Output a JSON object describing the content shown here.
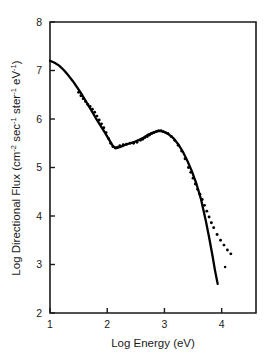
{
  "chart_data": {
    "type": "line",
    "title": "",
    "xlabel": "Log Energy (eV)",
    "ylabel": "Log Directional Flux (cm-2 sec-1 ster-1 eV-1)",
    "ylabel_parts": {
      "main": "Log Directional Flux  (cm",
      "sup1": "-2",
      "mid1": " sec",
      "sup2": "-1",
      "mid2": " ster",
      "sup3": "-1",
      "mid3": " eV",
      "sup4": "-1",
      "tail": ")"
    },
    "xlim": [
      1,
      4.6
    ],
    "ylim": [
      2,
      8
    ],
    "xticks": [
      1,
      2,
      3,
      4
    ],
    "xticklabels": [
      "1",
      "2",
      "3",
      "4"
    ],
    "yticks": [
      2,
      3,
      4,
      5,
      6,
      7,
      8
    ],
    "yticklabels": [
      "2",
      "3",
      "4",
      "5",
      "6",
      "7",
      "8"
    ],
    "grid": false,
    "legend": false,
    "axis_color": "#1a1a1a",
    "curve_color": "#000000",
    "points_color": "#000000",
    "series": [
      {
        "name": "model curve",
        "style": "solid",
        "x": [
          1.0,
          1.08,
          1.16,
          1.24,
          1.32,
          1.4,
          1.48,
          1.56,
          1.64,
          1.72,
          1.8,
          1.88,
          1.96,
          2.04,
          2.1,
          2.16,
          2.24,
          2.32,
          2.4,
          2.48,
          2.56,
          2.64,
          2.72,
          2.8,
          2.88,
          2.94,
          3.0,
          3.08,
          3.16,
          3.24,
          3.32,
          3.4,
          3.48,
          3.56,
          3.64,
          3.72,
          3.78,
          3.84,
          3.88,
          3.93
        ],
        "y": [
          7.2,
          7.16,
          7.1,
          7.01,
          6.9,
          6.78,
          6.64,
          6.5,
          6.34,
          6.18,
          6.02,
          5.87,
          5.72,
          5.56,
          5.44,
          5.4,
          5.43,
          5.47,
          5.5,
          5.53,
          5.57,
          5.62,
          5.68,
          5.72,
          5.75,
          5.75,
          5.73,
          5.68,
          5.6,
          5.48,
          5.33,
          5.14,
          4.92,
          4.66,
          4.34,
          3.92,
          3.56,
          3.18,
          2.9,
          2.6
        ]
      },
      {
        "name": "measured data (dotted)",
        "style": "dotted",
        "x": [
          1.5,
          1.54,
          1.58,
          1.62,
          1.66,
          1.7,
          1.74,
          1.78,
          1.82,
          1.86,
          1.9,
          1.94,
          1.98,
          2.02,
          2.06,
          2.1,
          2.14,
          2.18,
          2.22,
          2.28,
          2.34,
          2.4,
          2.46,
          2.52,
          2.58,
          2.62,
          2.66,
          2.7,
          2.74,
          2.78,
          2.82,
          2.86,
          2.9,
          2.94,
          2.98,
          3.02,
          3.06,
          3.12,
          3.18,
          3.24,
          3.3,
          3.36,
          3.42,
          3.46,
          3.5,
          3.54,
          3.58,
          3.62,
          3.66,
          3.7,
          3.74,
          3.78,
          3.82,
          3.86,
          3.92,
          3.98,
          4.04,
          4.1,
          4.16
        ],
        "y": [
          6.55,
          6.48,
          6.42,
          6.36,
          6.3,
          6.26,
          6.2,
          6.14,
          6.06,
          5.98,
          5.9,
          5.82,
          5.72,
          5.6,
          5.5,
          5.43,
          5.4,
          5.42,
          5.45,
          5.47,
          5.48,
          5.5,
          5.5,
          5.52,
          5.56,
          5.58,
          5.62,
          5.64,
          5.67,
          5.7,
          5.72,
          5.74,
          5.76,
          5.76,
          5.74,
          5.72,
          5.7,
          5.64,
          5.56,
          5.46,
          5.34,
          5.18,
          5.0,
          4.9,
          4.78,
          4.66,
          4.55,
          4.45,
          4.34,
          4.22,
          4.1,
          3.98,
          3.86,
          3.76,
          3.62,
          3.5,
          3.4,
          3.3,
          3.22
        ]
      },
      {
        "name": "outlier point",
        "style": "point",
        "x": [
          4.06
        ],
        "y": [
          2.95
        ]
      }
    ]
  }
}
